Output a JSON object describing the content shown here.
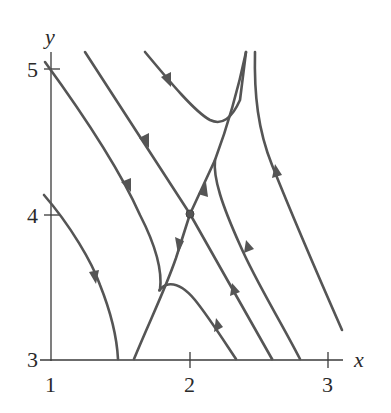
{
  "figure": {
    "type": "phase-portrait",
    "axes": {
      "x_label": "x",
      "y_label": "y",
      "x_ticks": [
        "1",
        "2",
        "3"
      ],
      "y_ticks": [
        "3",
        "4",
        "5"
      ],
      "x_range": [
        1,
        3.1
      ],
      "y_range": [
        3,
        5.2
      ]
    },
    "equilibrium": {
      "x": 2,
      "y": 4,
      "kind": "saddle"
    },
    "colors": {
      "trajectory": "#555555",
      "axis": "#3a3a3a",
      "background": "#ffffff"
    },
    "trajectory_count": 10
  }
}
